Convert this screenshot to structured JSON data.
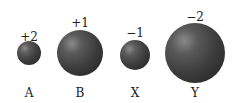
{
  "ions": [
    {
      "id": "A",
      "label": "A",
      "charge": "+2",
      "cx": 29,
      "cy": 53,
      "r": 12,
      "charge_y": 31
    },
    {
      "id": "B",
      "label": "B",
      "charge": "+1",
      "cx": 80,
      "cy": 53,
      "r": 23,
      "charge_y": 17
    },
    {
      "id": "X",
      "label": "X",
      "charge": "−1",
      "cx": 135,
      "cy": 55,
      "r": 15,
      "charge_y": 27
    },
    {
      "id": "Y",
      "label": "Y",
      "charge": "−2",
      "cx": 195,
      "cy": 53,
      "r": 30,
      "charge_y": 11
    }
  ],
  "label_y": 87
}
